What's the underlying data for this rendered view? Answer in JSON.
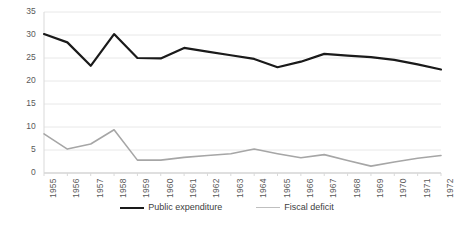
{
  "chart_data": {
    "type": "line",
    "title": "",
    "xlabel": "",
    "ylabel": "",
    "ylim": [
      0,
      35
    ],
    "yticks": [
      0,
      5,
      10,
      15,
      20,
      25,
      30,
      35
    ],
    "grid": true,
    "legend_position": "bottom",
    "categories": [
      "1955",
      "1956",
      "1957",
      "1958",
      "1959",
      "1960",
      "1961",
      "1962",
      "1963",
      "1964",
      "1965",
      "1966",
      "1967",
      "1968",
      "1969",
      "1970",
      "1971",
      "1972"
    ],
    "series": [
      {
        "name": "Public expenditure",
        "color": "#1a1a1a",
        "values": [
          30.2,
          28.4,
          23.3,
          30.2,
          25.0,
          24.9,
          27.2,
          26.4,
          25.6,
          24.8,
          23.0,
          24.2,
          25.9,
          25.5,
          25.2,
          24.6,
          23.6,
          22.5
        ]
      },
      {
        "name": "Fiscal deficit",
        "color": "#a6a6a6",
        "values": [
          8.5,
          5.2,
          6.3,
          9.4,
          2.8,
          2.8,
          3.4,
          3.8,
          4.2,
          5.2,
          4.2,
          3.3,
          4.0,
          2.7,
          1.5,
          2.4,
          3.2,
          3.8
        ]
      }
    ]
  },
  "legend": {
    "items": [
      {
        "label": "Public expenditure",
        "color": "#1a1a1a",
        "width": "2.4px"
      },
      {
        "label": "Fiscal deficit",
        "color": "#bfbfbf",
        "width": "1.6px"
      }
    ]
  }
}
